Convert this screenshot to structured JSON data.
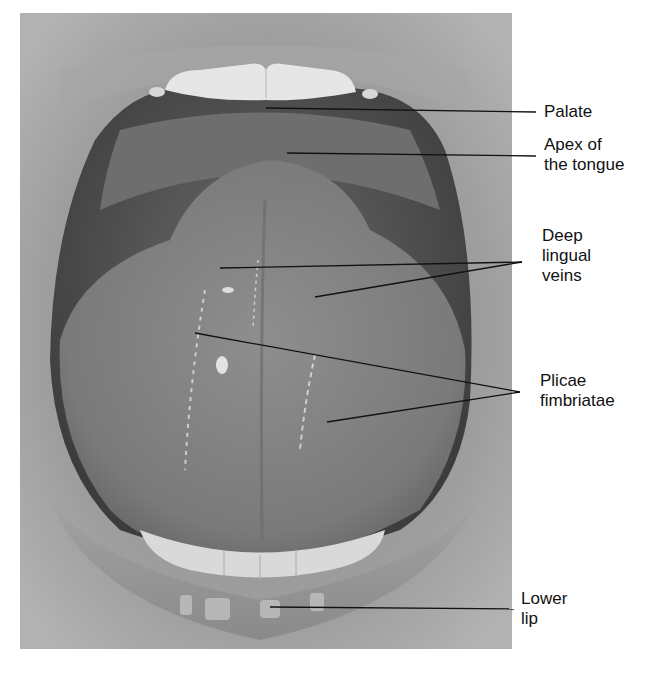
{
  "figure": {
    "colors": {
      "background": "#ffffff",
      "skin": "#9a9a9a",
      "oral_cavity": "#5e5e5e",
      "tongue": "#7f7f7f",
      "teeth": "#e4e4e4",
      "leader_line": "#111111",
      "label_text": "#111111"
    }
  },
  "labels": [
    {
      "id": "palate",
      "lines": [
        "Palate"
      ]
    },
    {
      "id": "apex",
      "lines": [
        "Apex of",
        "the tongue"
      ]
    },
    {
      "id": "deep-lingual-veins",
      "lines": [
        "Deep",
        "lingual",
        "veins"
      ]
    },
    {
      "id": "plicae-fimbriatae",
      "lines": [
        "Plicae",
        "fimbriatae"
      ]
    },
    {
      "id": "lower-lip",
      "lines": [
        "Lower",
        "lip"
      ]
    }
  ]
}
